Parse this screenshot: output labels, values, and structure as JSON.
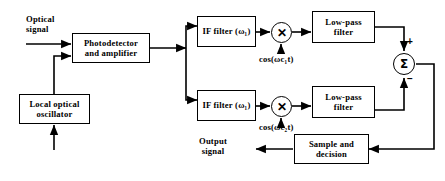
{
  "diagram": {
    "stroke_color": "#000000",
    "background_color": "#ffffff",
    "blocks": [
      {
        "id": "photodetector",
        "lines": [
          "Photodetector",
          "and  amplifier"
        ]
      },
      {
        "id": "local-oscillator",
        "lines": [
          "Local  optical",
          "oscillator"
        ]
      },
      {
        "id": "if-filter-upper",
        "lines": [
          "IF  filter  (ω₁)"
        ]
      },
      {
        "id": "if-filter-lower",
        "lines": [
          "IF  filter  (ω₁)"
        ]
      },
      {
        "id": "low-pass-filter-upper",
        "lines": [
          "Low-pass",
          "filter"
        ]
      },
      {
        "id": "low-pass-filter-lower",
        "lines": [
          "Low-pass",
          "filter"
        ]
      },
      {
        "id": "sample-and-decision",
        "lines": [
          "Sample  and",
          "decision"
        ]
      }
    ],
    "nodes": [
      {
        "id": "mixer-upper",
        "symbol": "✕"
      },
      {
        "id": "mixer-lower",
        "symbol": "✕"
      },
      {
        "id": "summing-junction",
        "symbol": "Σ"
      }
    ],
    "labels": {
      "optical_signal": [
        "Optical",
        "signal"
      ],
      "lo_carrier_upper": "cos(ωc₁t)",
      "lo_carrier_lower": "cos(ωc₂t)",
      "output_signal": [
        "Output",
        "signal"
      ],
      "sum_plus": "+",
      "sum_minus": "−"
    }
  }
}
